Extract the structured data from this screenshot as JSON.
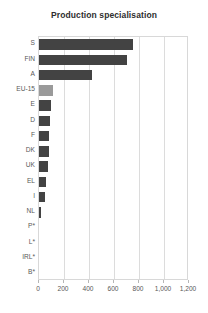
{
  "chart_data": {
    "type": "bar",
    "orientation": "horizontal",
    "title": "Production specialisation",
    "xlabel": "",
    "ylabel": "",
    "xlim": [
      0,
      1200
    ],
    "x_ticks": [
      0,
      200,
      400,
      600,
      800,
      1000,
      1200
    ],
    "x_tick_labels": [
      "0",
      "200",
      "400",
      "600",
      "800",
      "1,000",
      "1,200"
    ],
    "grid": true,
    "grid_axis": "x",
    "legend": null,
    "categories": [
      "S",
      "FIN",
      "A",
      "EU-15",
      "E",
      "D",
      "F",
      "DK",
      "UK",
      "EL",
      "I",
      "NL",
      "P*",
      "L*",
      "IRL*",
      "B*"
    ],
    "values": [
      752,
      702,
      420,
      112,
      92,
      86,
      80,
      76,
      70,
      58,
      50,
      16,
      0,
      0,
      0,
      0
    ],
    "highlight_category": "EU-15",
    "colors": {
      "bar": "#434343",
      "bar_highlight": "#9a9a9a",
      "grid": "#dcdcdc",
      "frame": "#d8d8d8",
      "text": "#585858",
      "title": "#2e2e2e",
      "background": "#ffffff"
    }
  }
}
